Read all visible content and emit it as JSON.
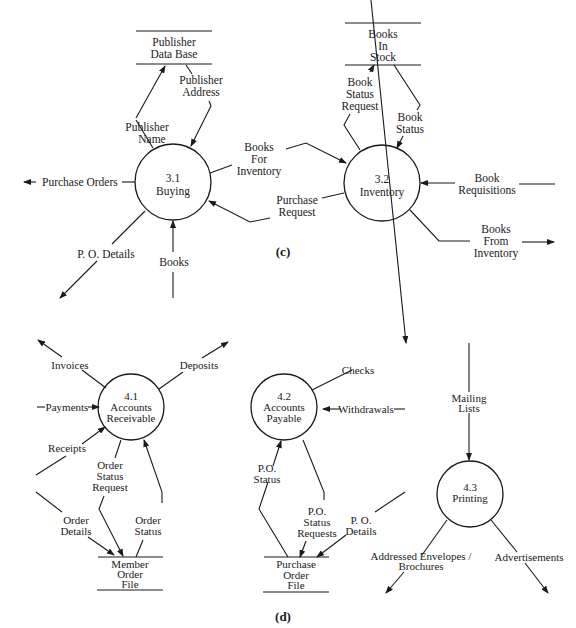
{
  "figure_c": {
    "caption": "(c)",
    "processes": [
      {
        "id": "3.1",
        "name": "Buying"
      },
      {
        "id": "3.2",
        "name": "Inventory"
      }
    ],
    "stores": [
      {
        "line1": "Publisher",
        "line2": "Data Base"
      },
      {
        "line1": "Books",
        "line2": "In",
        "line3": "Stock"
      }
    ],
    "flows": {
      "publisher_name": {
        "line1": "Publisher",
        "line2": "Name"
      },
      "publisher_address": {
        "line1": "Publisher",
        "line2": "Address"
      },
      "purchase_orders": "Purchase Orders",
      "po_details": "P. O. Details",
      "books": "Books",
      "books_for_inventory": {
        "line1": "Books",
        "line2": "For",
        "line3": "Inventory"
      },
      "purchase_request": {
        "line1": "Purchase",
        "line2": "Request"
      },
      "book_status_request": {
        "line1": "Book",
        "line2": "Status",
        "line3": "Request"
      },
      "book_status": {
        "line1": "Book",
        "line2": "Status"
      },
      "book_requisitions": {
        "line1": "Book",
        "line2": "Requisitions"
      },
      "books_from_inventory": {
        "line1": "Books",
        "line2": "From",
        "line3": "Inventory"
      }
    }
  },
  "figure_d": {
    "caption": "(d)",
    "processes": [
      {
        "id": "4.1",
        "line1": "Accounts",
        "line2": "Receivable"
      },
      {
        "id": "4.2",
        "line1": "Accounts",
        "line2": "Payable"
      },
      {
        "id": "4.3",
        "line1": "Printing"
      }
    ],
    "stores": [
      {
        "line1": "Member",
        "line2": "Order",
        "line3": "File"
      },
      {
        "line1": "Purchase",
        "line2": "Order",
        "line3": "File"
      }
    ],
    "flows": {
      "invoices": "Invoices",
      "deposits": "Deposits",
      "payments": "Payments",
      "receipts": "Receipts",
      "order_status_request": {
        "line1": "Order",
        "line2": "Status",
        "line3": "Request"
      },
      "order_status": {
        "line1": "Order",
        "line2": "Status"
      },
      "order_details": {
        "line1": "Order",
        "line2": "Details"
      },
      "checks": "Checks",
      "withdrawals": "Withdrawals",
      "po_status": {
        "line1": "P.O.",
        "line2": "Status"
      },
      "po_status_requests": {
        "line1": "P.O.",
        "line2": "Status",
        "line3": "Requests"
      },
      "po_details": {
        "line1": "P. O.",
        "line2": "Details"
      },
      "mailing_lists": {
        "line1": "Mailing",
        "line2": "Lists"
      },
      "addressed_envelopes": {
        "line1": "Addressed Envelopes /",
        "line2": "Brochures"
      },
      "advertisements": "Advertisements"
    }
  }
}
